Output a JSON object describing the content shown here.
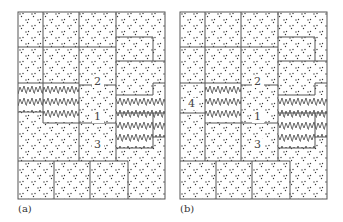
{
  "figure": {
    "panels": [
      {
        "id": "a",
        "caption": "(a)",
        "offset_x": 18,
        "labels": [
          {
            "text": "2",
            "x": 92,
            "y": 73
          },
          {
            "text": "1",
            "x": 92,
            "y": 108
          },
          {
            "text": "3",
            "x": 92,
            "y": 143
          }
        ]
      },
      {
        "id": "b",
        "caption": "(b)",
        "offset_x": 180,
        "labels": [
          {
            "text": "2",
            "x": 88,
            "y": 73
          },
          {
            "text": "1",
            "x": 88,
            "y": 108
          },
          {
            "text": "3",
            "x": 88,
            "y": 143
          },
          {
            "text": "4",
            "x": 12,
            "y": 99
          }
        ]
      }
    ],
    "legend": {
      "dotted_pattern": "stippled region",
      "zigzag_pattern": "zigzag hatched region"
    }
  }
}
